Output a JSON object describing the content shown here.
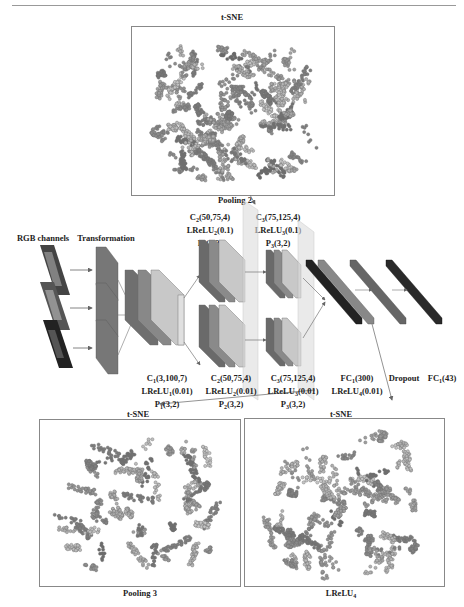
{
  "page": {
    "number": "..."
  },
  "figure": {
    "top_tsne": {
      "title": "t-SNE",
      "caption": "Pooling 2"
    },
    "bottom_left_tsne": {
      "title": "t-SNE",
      "caption": "Pooling 3"
    },
    "bottom_right_tsne": {
      "title": "t-SNE",
      "caption": "LReLU",
      "caption_sub": "4"
    },
    "inputs": {
      "rgb_label": "RGB channels",
      "transform_label": "Transformation"
    },
    "layers": {
      "stage1": {
        "conv": "C",
        "conv_sub": "1",
        "conv_args": "(3,100,7)",
        "act": "LReLU",
        "act_sub": "1",
        "act_args": "(0.01)",
        "pool": "P",
        "pool_sub": "1",
        "pool_args": "(3,2)"
      },
      "stage2_top": {
        "conv": "C",
        "conv_sub": "2",
        "conv_args": "(50,75,4)",
        "act": "LReLU",
        "act_sub": "2",
        "act_args": "(0.1)",
        "pool": "P",
        "pool_sub": "2",
        "pool_args": "(3,2)"
      },
      "stage2_bottom": {
        "conv": "C",
        "conv_sub": "2",
        "conv_args": "(50,75,4)",
        "act": "LReLU",
        "act_sub": "2",
        "act_args": "(0.01)",
        "pool": "P",
        "pool_sub": "2",
        "pool_args": "(3,2)"
      },
      "stage3_top": {
        "conv": "C",
        "conv_sub": "3",
        "conv_args": "(75,125,4)",
        "act": "LReLU",
        "act_sub": "3",
        "act_args": "(0.1)",
        "pool": "P",
        "pool_sub": "3",
        "pool_args": "(3,2)"
      },
      "stage3_bottom": {
        "conv": "C",
        "conv_sub": "3",
        "conv_args": "(75,125,4)",
        "act": "LReLU",
        "act_sub": "3",
        "act_args": "(0.01)",
        "pool": "P",
        "pool_sub": "3",
        "pool_args": "(3,2)"
      },
      "fc1": {
        "name": "FC",
        "sub": "1",
        "args": "(300)",
        "act": "LReLU",
        "act_sub": "4",
        "act_args": "(0.01)"
      },
      "dropout": {
        "label": "Dropout"
      },
      "fc2": {
        "name": "FC",
        "sub": "1",
        "args": "(43)"
      }
    }
  }
}
